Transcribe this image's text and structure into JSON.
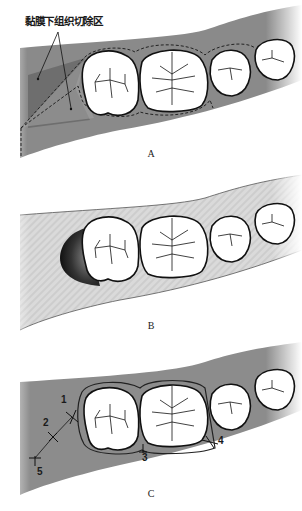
{
  "figure": {
    "panels": [
      {
        "id": "A",
        "label": "A",
        "callout": "黏膜下组织切除区",
        "gum_color": "#8a8a8a",
        "excision_zone_color": "#6f6f6f",
        "description": "Distal wedge outline with dashed incision lines around molars"
      },
      {
        "id": "B",
        "label": "B",
        "gum_color": "#d9d9d9",
        "description": "Tissue excised distal to last molar"
      },
      {
        "id": "C",
        "label": "C",
        "gum_color": "#8c8c8c",
        "description": "Flap closed with sutures",
        "sutures": [
          {
            "number": "1"
          },
          {
            "number": "2"
          },
          {
            "number": "3"
          },
          {
            "number": "4"
          },
          {
            "number": "5"
          }
        ]
      }
    ]
  }
}
